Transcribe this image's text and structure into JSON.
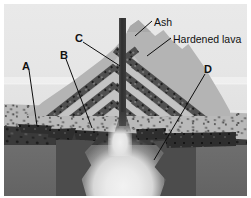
{
  "figure": {
    "width": 251,
    "height": 198,
    "background_color": "#ffffff",
    "frame_color": "#e7e7e7"
  },
  "colors": {
    "sky": "#e7e7e7",
    "cone_ash": "#b4b4b4",
    "hardened_lava": "#4f4f4f",
    "sediment_layer": "#b9b9b9",
    "dark_rock_layer": "#3a3a3a",
    "bedrock": "#6a6a6a",
    "magma": "#efefef",
    "conduit": "#2f2f2f",
    "label_text": "#111111",
    "leader_line": "#0d0d0d"
  },
  "labels": [
    {
      "id": "label-a",
      "text": "A",
      "x": 18,
      "y": 57,
      "type": "letter"
    },
    {
      "id": "label-b",
      "text": "B",
      "x": 56,
      "y": 46,
      "type": "letter"
    },
    {
      "id": "label-c",
      "text": "C",
      "x": 71,
      "y": 29,
      "type": "letter"
    },
    {
      "id": "label-d",
      "text": "D",
      "x": 200,
      "y": 60,
      "type": "letter"
    },
    {
      "id": "label-ash",
      "text": "Ash",
      "x": 150,
      "y": 13,
      "type": "word"
    },
    {
      "id": "label-hardened-lava",
      "text": "Hardened lava",
      "x": 169,
      "y": 30,
      "type": "word"
    }
  ],
  "leaders": [
    {
      "id": "leader-a",
      "from": [
        25,
        66
      ],
      "to": [
        33,
        122
      ]
    },
    {
      "id": "leader-b",
      "from": [
        62,
        55
      ],
      "to": [
        88,
        124
      ]
    },
    {
      "id": "leader-c",
      "from": [
        79,
        38
      ],
      "to": [
        116,
        62
      ]
    },
    {
      "id": "leader-d",
      "from": [
        201,
        70
      ],
      "to": [
        150,
        156
      ]
    },
    {
      "id": "leader-ash",
      "from": [
        148,
        17
      ],
      "to": [
        131,
        32
      ]
    },
    {
      "id": "leader-hardened-lava",
      "from": [
        167,
        34
      ],
      "to": [
        143,
        52
      ]
    }
  ],
  "diagram_parts": [
    {
      "name": "sky",
      "description": "light gray background sky"
    },
    {
      "name": "volcano-cone",
      "description": "stratovolcano cone of alternating ash and hardened lava layers"
    },
    {
      "name": "central-conduit",
      "description": "dark vertical vent pipe running through the cone"
    },
    {
      "name": "ground-sediment",
      "description": "speckled sediment layer at the surface"
    },
    {
      "name": "ground-dark-rock",
      "description": "dark rock layer beneath the sediment"
    },
    {
      "name": "bedrock",
      "description": "solid gray bedrock at depth"
    },
    {
      "name": "magma-chamber",
      "description": "light magma plume rising from depth"
    },
    {
      "name": "sills",
      "description": "dark intrusive sills branching under the flanks"
    }
  ],
  "strata": {
    "lava_band_count": 5,
    "ash_band_count": 5,
    "left_slope_angle_deg": -38,
    "right_slope_angle_deg": 38
  }
}
